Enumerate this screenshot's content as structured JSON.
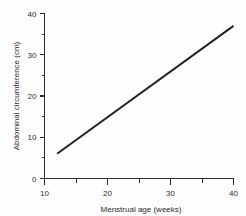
{
  "chart_data": {
    "type": "line",
    "title": "",
    "subtitle": "",
    "xlabel": "Menstrual age (weeks)",
    "ylabel": "Abdominal circumference (cm)",
    "xlim": [
      10,
      40
    ],
    "ylim": [
      0,
      40
    ],
    "grid": false,
    "legend": false,
    "legend_position": "none",
    "x_major_ticks": [
      10,
      20,
      30,
      40
    ],
    "x_minor_ticks": [
      15,
      25,
      35
    ],
    "y_major_ticks": [
      0,
      10,
      20,
      30,
      40
    ],
    "y_minor_ticks": [
      5,
      15,
      25,
      35
    ],
    "x_tick_labels": [
      "10",
      "20",
      "30",
      "40"
    ],
    "y_tick_labels": [
      "0",
      "10",
      "20",
      "30",
      "40"
    ],
    "series": [
      {
        "name": "Abdominal circumference",
        "color": "#232323",
        "x": [
          12,
          40
        ],
        "values": [
          6,
          37
        ]
      }
    ],
    "annotations": []
  },
  "colors": {
    "background": "#fefefe",
    "axis": "#2b2b2b",
    "line": "#232323",
    "text": "#2a2a2a"
  }
}
